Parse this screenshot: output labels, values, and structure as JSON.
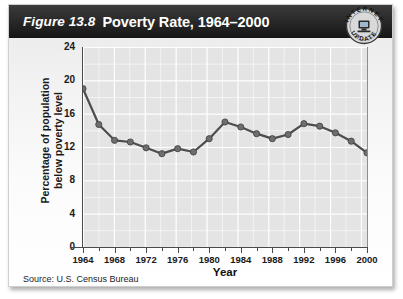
{
  "figure": {
    "number_label": "Figure 13.8",
    "title": "Poverty Rate, 1964–2000",
    "badge": {
      "line1": "INTERNET",
      "line2": "UPDATE",
      "icon": "computer-icon"
    },
    "source": "Source: U.S. Census Bureau"
  },
  "colors": {
    "title_bar": "#1a1a1a",
    "title_text": "#ffffff",
    "plot_background": "#e4e4e4",
    "gridline": "#ffffff",
    "line": "#4d4d4d",
    "marker": "#6e6e6e",
    "axis": "#4a4a4a",
    "card_background": "#f2f2f2"
  },
  "chart_data": {
    "type": "line",
    "title": "Poverty Rate, 1964–2000",
    "xlabel": "Year",
    "ylabel": "Percentage of population below poverty level",
    "xlim": [
      1964,
      2000
    ],
    "ylim": [
      0,
      24
    ],
    "ytick_values": [
      0,
      4,
      8,
      12,
      16,
      20,
      24
    ],
    "ytick_labels": [
      "0",
      "4",
      "8",
      "12",
      "16",
      "20",
      "24"
    ],
    "ytick_minor_step": 2,
    "xtick_values": [
      1964,
      1968,
      1972,
      1976,
      1980,
      1984,
      1988,
      1992,
      1996,
      2000
    ],
    "xtick_labels": [
      "1964",
      "1968",
      "1972",
      "1976",
      "1980",
      "1984",
      "1988",
      "1992",
      "1996",
      "2000"
    ],
    "xtick_minor_step": 2,
    "grid": true,
    "legend": null,
    "x": [
      1964,
      1966,
      1968,
      1970,
      1972,
      1974,
      1976,
      1978,
      1980,
      1982,
      1984,
      1986,
      1988,
      1990,
      1992,
      1994,
      1996,
      1998,
      2000
    ],
    "values": [
      19.0,
      14.7,
      12.8,
      12.6,
      11.9,
      11.2,
      11.8,
      11.4,
      13.0,
      15.0,
      14.4,
      13.6,
      13.0,
      13.5,
      14.8,
      14.5,
      13.7,
      12.7,
      11.3
    ],
    "series": [
      {
        "name": "Percentage of population below poverty level",
        "values": [
          19.0,
          14.7,
          12.8,
          12.6,
          11.9,
          11.2,
          11.8,
          11.4,
          13.0,
          15.0,
          14.4,
          13.6,
          13.0,
          13.5,
          14.8,
          14.5,
          13.7,
          12.7,
          11.3
        ]
      }
    ],
    "marker": "circle",
    "line_width": 2.2
  }
}
